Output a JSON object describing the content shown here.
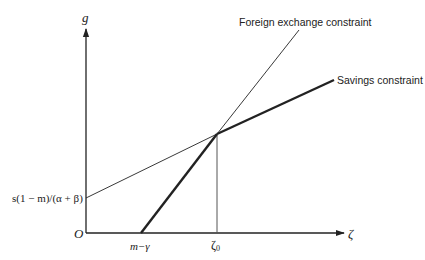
{
  "diagram": {
    "type": "economic two-gap model",
    "axes": {
      "y_label": "g",
      "x_label": "ζ",
      "origin_label": "O"
    },
    "x_ticks": {
      "m_gamma": "m−γ",
      "zeta0_base": "ζ",
      "zeta0_sub": "0"
    },
    "y_intercept_label": "s(1 − m)/(α + β)",
    "curves": [
      {
        "name": "Foreign exchange constraint",
        "style": "thin"
      },
      {
        "name": "Savings constraint",
        "style": "thick"
      }
    ],
    "labels": {
      "foreign_exchange": "Foreign exchange constraint",
      "savings": "Savings constraint"
    },
    "colors": {
      "line": "#222222",
      "background": "#ffffff"
    }
  }
}
